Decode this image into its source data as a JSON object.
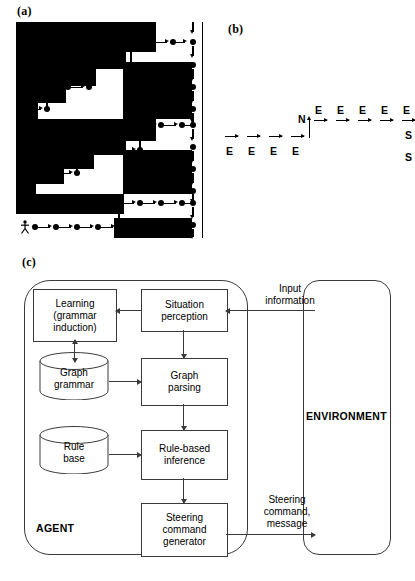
{
  "figure": {
    "panels": [
      {
        "id": "a",
        "label": "(a)"
      },
      {
        "id": "b",
        "label": "(b)"
      },
      {
        "id": "c",
        "label": "(c)"
      }
    ]
  },
  "panel_a": {
    "label": "(a)",
    "description": "staircase maze with agent path of arrows and nodes",
    "agent_icon": "stick-figure-icon",
    "colors": {
      "wall": "#000000",
      "corridor": "#ffffff",
      "path": "#000000"
    }
  },
  "panel_b": {
    "label": "(b)",
    "symbols": [
      "E",
      "E",
      "E",
      "E",
      "N",
      "E",
      "E",
      "E",
      "E",
      "E",
      "S",
      "S"
    ],
    "bottom_row_labels": [
      "E",
      "E",
      "E",
      "E"
    ],
    "turn_label": "N",
    "top_row_labels": [
      "E",
      "E",
      "E",
      "E",
      "E"
    ],
    "tail_labels": [
      "S",
      "S"
    ],
    "formula_base": [
      "E",
      "N",
      "E",
      "S"
    ],
    "formula_exponents": [
      "4",
      "",
      "5",
      "2"
    ],
    "formula_text": "E4NE5S2"
  },
  "panel_c": {
    "label": "(c)",
    "agent_label": "AGENT",
    "environment_label": "ENVIRONMENT",
    "boxes": [
      {
        "id": "learning",
        "lines": [
          "Learning",
          "(grammar",
          "induction)"
        ]
      },
      {
        "id": "situation-perception",
        "lines": [
          "Situation",
          "perception"
        ]
      },
      {
        "id": "graph-parsing",
        "lines": [
          "Graph",
          "parsing"
        ]
      },
      {
        "id": "rule-based-inference",
        "lines": [
          "Rule-based",
          "inference"
        ]
      },
      {
        "id": "steering-command-generator",
        "lines": [
          "Steering",
          "command",
          "generator"
        ]
      }
    ],
    "stores": [
      {
        "id": "graph-grammar",
        "lines": [
          "Graph",
          "grammar"
        ]
      },
      {
        "id": "rule-base",
        "lines": [
          "Rule",
          "base"
        ]
      }
    ],
    "edge_labels": [
      {
        "id": "input-information",
        "lines": [
          "Input",
          "information"
        ]
      },
      {
        "id": "steering-command-message",
        "lines": [
          "Steering",
          "command,",
          "message"
        ]
      }
    ],
    "colors": {
      "line": "#3a3a3a",
      "box_fill": "#ffffff",
      "text": "#000000"
    }
  }
}
